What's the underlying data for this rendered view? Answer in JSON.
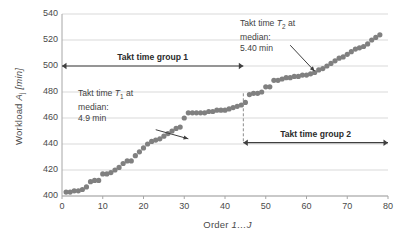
{
  "chart_data": {
    "type": "scatter",
    "title": "",
    "xlabel": "Order 1…J",
    "ylabel": "Workload Aⱼ [min]",
    "ylabel_parts": {
      "prefix": "Workload ",
      "symbol": "A",
      "subscript": "j",
      "unit": " [min]"
    },
    "xlabel_parts": {
      "prefix": "Order ",
      "italic": "1…J"
    },
    "xlim": [
      0,
      80
    ],
    "ylim": [
      400,
      540
    ],
    "xticks": [
      0,
      10,
      20,
      30,
      40,
      50,
      60,
      70,
      80
    ],
    "yticks": [
      400,
      420,
      440,
      460,
      480,
      500,
      520,
      540
    ],
    "grid": "horizontal",
    "legend": "none",
    "marker_color": "#808080",
    "marker_size": 2.6,
    "series": [
      {
        "name": "Workload per order",
        "x": [
          1,
          2,
          3,
          4,
          5,
          6,
          7,
          8,
          9,
          10,
          11,
          12,
          13,
          14,
          15,
          16,
          17,
          18,
          19,
          20,
          21,
          22,
          23,
          24,
          25,
          26,
          27,
          28,
          29,
          30,
          31,
          32,
          33,
          34,
          35,
          36,
          37,
          38,
          39,
          40,
          41,
          42,
          43,
          44,
          45,
          46,
          47,
          48,
          49,
          50,
          51,
          52,
          53,
          54,
          55,
          56,
          57,
          58,
          59,
          60,
          61,
          62,
          63,
          64,
          65,
          66,
          67,
          68,
          69,
          70,
          71,
          72,
          73,
          74,
          75,
          76,
          77,
          78
        ],
        "y": [
          403,
          403,
          404,
          404,
          405,
          407,
          411,
          412,
          412,
          417,
          417,
          418,
          420,
          422,
          425,
          427,
          427,
          431,
          434,
          437,
          440,
          442,
          443,
          444,
          446,
          448,
          450,
          452,
          453,
          460,
          464,
          464,
          464,
          464,
          464,
          465,
          465,
          466,
          466,
          466,
          467,
          468,
          469,
          470,
          472,
          478,
          479,
          479,
          480,
          484,
          484,
          489,
          489,
          490,
          491,
          491,
          492,
          492,
          493,
          493,
          494,
          495,
          497,
          498,
          500,
          502,
          504,
          506,
          507,
          509,
          511,
          513,
          514,
          515,
          517,
          520,
          522,
          524
        ]
      }
    ],
    "annotations": [
      {
        "id": "takt-1",
        "lines": [
          "Takt time T₁ at",
          "median:",
          "4.9 min"
        ],
        "line1_prefix": "Takt time ",
        "line1_symbol": "T",
        "line1_sub": "1",
        "line1_suffix": " at",
        "line2": "median:",
        "line3": "4.9 min",
        "arrow_from": [
          23,
          451
        ],
        "arrow_to": [
          31,
          444
        ]
      },
      {
        "id": "takt-2",
        "lines": [
          "Takt time T₂ at",
          "median:",
          "5.40 min"
        ],
        "line1_prefix": "Takt time ",
        "line1_symbol": "T",
        "line1_sub": "2",
        "line1_suffix": " at",
        "line2": "median:",
        "line3": "5.40 min",
        "arrow_from": [
          56,
          516
        ],
        "arrow_to": [
          62,
          496
        ]
      }
    ],
    "spans": [
      {
        "id": "group-1",
        "label": "Takt time group 1",
        "x_from": 0,
        "x_to": 44.5,
        "y": 500
      },
      {
        "id": "group-2",
        "label": "Takt time group 2",
        "x_from": 44.5,
        "x_to": 80,
        "y": 441
      }
    ],
    "divider": {
      "id": "group-divider",
      "x": 44.5,
      "y_from": 441,
      "y_to": 479,
      "style": "dashed"
    }
  }
}
